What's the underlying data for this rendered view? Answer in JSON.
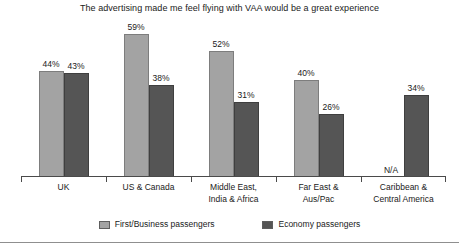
{
  "chart_data": {
    "type": "bar",
    "title": "The advertising made me feel flying with VAA would be a great experience",
    "xlabel": "",
    "ylabel": "",
    "ylim": [
      0,
      65
    ],
    "grid": false,
    "legend_position": "bottom",
    "value_suffix": "%",
    "categories": [
      "UK",
      "US & Canada",
      "Middle East, India & Africa",
      "Far East & Aus/Pac",
      "Caribbean & Central America"
    ],
    "category_lines": [
      [
        "UK"
      ],
      [
        "US & Canada"
      ],
      [
        "Middle East,",
        "India & Africa"
      ],
      [
        "Far East &",
        "Aus/Pac"
      ],
      [
        "Caribbean &",
        "Central America"
      ]
    ],
    "series": [
      {
        "name": "First/Business passengers",
        "color": "#a3a3a3",
        "values": [
          44,
          59,
          52,
          40,
          null
        ],
        "labels": [
          "44%",
          "59%",
          "52%",
          "40%",
          "N/A"
        ]
      },
      {
        "name": "Economy passengers",
        "color": "#555555",
        "values": [
          43,
          38,
          31,
          26,
          34
        ],
        "labels": [
          "43%",
          "38%",
          "31%",
          "26%",
          "34%"
        ]
      }
    ]
  },
  "legend": {
    "items": [
      {
        "label": "First/Business passengers"
      },
      {
        "label": "Economy passengers"
      }
    ]
  }
}
